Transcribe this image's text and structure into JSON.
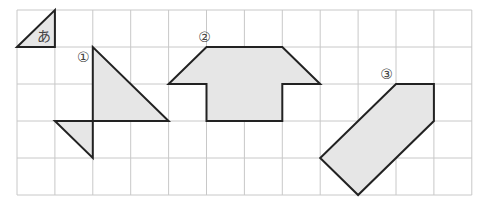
{
  "grid": {
    "cols": 12,
    "rows": 5,
    "origin_x": 17,
    "origin_y": 10,
    "cell_w": 37.9,
    "cell_h": 37,
    "line_color": "#c8c8c8"
  },
  "colors": {
    "fill": "#e6e6e6",
    "stroke": "#222222"
  },
  "shapes": [
    {
      "id": "a",
      "label": "あ",
      "points": [
        [
          0,
          1
        ],
        [
          1,
          0
        ],
        [
          1,
          1
        ]
      ],
      "label_pos": [
        0.72,
        0.72
      ]
    },
    {
      "id": "1",
      "label": "①",
      "parts": [
        [
          [
            2,
            1
          ],
          [
            2,
            3
          ],
          [
            4,
            3
          ]
        ],
        [
          [
            1,
            3
          ],
          [
            2,
            3
          ],
          [
            2,
            4
          ]
        ]
      ],
      "label_pos": [
        1.75,
        1.3
      ]
    },
    {
      "id": "2",
      "label": "②",
      "points": [
        [
          5,
          1
        ],
        [
          7,
          1
        ],
        [
          8,
          2
        ],
        [
          7,
          2
        ],
        [
          7,
          3
        ],
        [
          5,
          3
        ],
        [
          5,
          2
        ],
        [
          4,
          2
        ]
      ],
      "label_pos": [
        4.95,
        0.75
      ]
    },
    {
      "id": "3",
      "label": "③",
      "points": [
        [
          10,
          2
        ],
        [
          11,
          2
        ],
        [
          11,
          3
        ],
        [
          9,
          5
        ],
        [
          8,
          4
        ]
      ],
      "label_pos": [
        9.75,
        1.75
      ]
    }
  ]
}
